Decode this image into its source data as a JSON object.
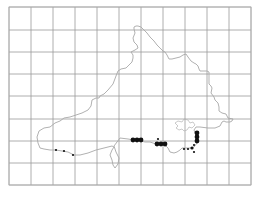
{
  "map": {
    "type": "distribution-map",
    "region": "county outline with 10km grid",
    "colors": {
      "background": "#ffffff",
      "grid": "#9a9a9a",
      "coastline": "#a8a8a8",
      "record_dot": "#111111"
    },
    "grid": {
      "x_lines": [
        9,
        31,
        53,
        75,
        97,
        119,
        141,
        163,
        185,
        207,
        229,
        251
      ],
      "y_lines": [
        7,
        30,
        52,
        74,
        96,
        119,
        141,
        163,
        185
      ]
    },
    "records": [
      {
        "x": 56,
        "y": 150,
        "size": "small"
      },
      {
        "x": 64,
        "y": 151,
        "size": "small"
      },
      {
        "x": 73,
        "y": 155,
        "size": "small"
      },
      {
        "x": 133,
        "y": 140,
        "size": "large"
      },
      {
        "x": 137,
        "y": 140,
        "size": "large"
      },
      {
        "x": 141,
        "y": 140,
        "size": "large"
      },
      {
        "x": 158,
        "y": 139,
        "size": "small"
      },
      {
        "x": 157,
        "y": 144,
        "size": "large"
      },
      {
        "x": 161,
        "y": 144,
        "size": "large"
      },
      {
        "x": 165,
        "y": 144,
        "size": "large"
      },
      {
        "x": 197,
        "y": 133,
        "size": "large"
      },
      {
        "x": 197,
        "y": 137,
        "size": "large"
      },
      {
        "x": 197,
        "y": 141,
        "size": "large"
      },
      {
        "x": 184,
        "y": 149,
        "size": "small"
      },
      {
        "x": 188,
        "y": 149,
        "size": "small"
      },
      {
        "x": 192,
        "y": 148,
        "size": "medium"
      },
      {
        "x": 194,
        "y": 145,
        "size": "small"
      },
      {
        "x": 194,
        "y": 152,
        "size": "small"
      }
    ]
  }
}
